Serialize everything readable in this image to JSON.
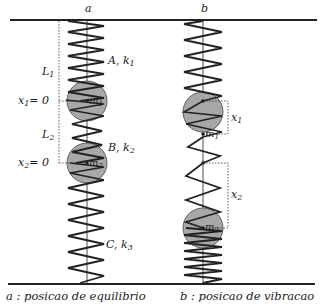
{
  "diagram": {
    "column_a": {
      "label": "a",
      "caption": "a : posicao de equilibrio",
      "spring_A": "A, k",
      "spring_A_sub": "1",
      "spring_B": "B, k",
      "spring_B_sub": "2",
      "spring_C": "C, k",
      "spring_C_sub": "3",
      "L1": "L",
      "L1_sub": "1",
      "L2": "L",
      "L2_sub": "2",
      "x1_zero": "x",
      "x1_zero_sub": "1",
      "x1_zero_val": "= 0",
      "x2_zero": "x",
      "x2_zero_sub": "2",
      "x2_zero_val": "= 0",
      "mass1": "m",
      "mass1_sub": "1",
      "mass2": "m",
      "mass2_sub": "2"
    },
    "column_b": {
      "label": "b",
      "caption": "b : posicao de vibracao",
      "x1": "x",
      "x1_sub": "1",
      "x2": "x",
      "x2_sub": "2",
      "mass1": "m",
      "mass1_sub": "1",
      "mass2": "m",
      "mass2_sub": "2"
    },
    "colors": {
      "mass_fill": "#a8a8a8",
      "line": "#222222"
    }
  }
}
